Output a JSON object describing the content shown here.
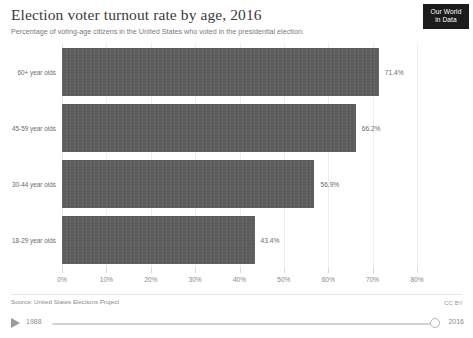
{
  "header": {
    "title": "Election voter turnout rate by age, 2016",
    "subtitle": "Percentage of voting-age citizens in the United States who voted in the presidential election."
  },
  "logo": {
    "line1": "Our World",
    "line2": "in Data"
  },
  "footer": {
    "source": "Source: United States Elections Project",
    "license": "CC BY"
  },
  "timeline": {
    "start_year": "1988",
    "end_year": "2016",
    "play_icon": "play-icon"
  },
  "chart_data": {
    "type": "bar",
    "orientation": "horizontal",
    "title": "Election voter turnout rate by age, 2016",
    "subtitle": "Percentage of voting-age citizens in the United States who voted in the presidential election.",
    "categories": [
      "60+ year olds",
      "45-59 year olds",
      "30-44 year olds",
      "18-29 year olds"
    ],
    "values": [
      71.4,
      66.2,
      56.9,
      43.4
    ],
    "value_labels": [
      "71.4%",
      "66.2%",
      "56.9%",
      "43.4%"
    ],
    "xlabel": "",
    "ylabel": "",
    "xlim": [
      0,
      80
    ],
    "xticks": [
      0,
      10,
      20,
      30,
      40,
      50,
      60,
      70,
      80
    ],
    "xtick_labels": [
      "0%",
      "10%",
      "20%",
      "30%",
      "40%",
      "50%",
      "60%",
      "70%",
      "80%"
    ],
    "grid": true,
    "legend": false,
    "bar_color": "#5b5b5b",
    "gridline_color": "#ededed",
    "text_color": "#6b6b6b"
  }
}
